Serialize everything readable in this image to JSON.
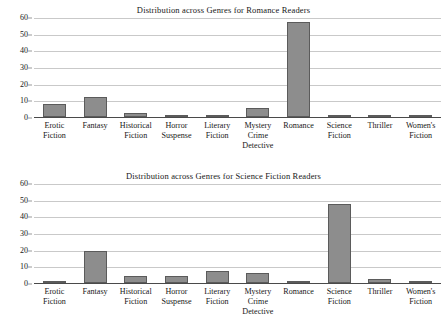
{
  "chart_data": [
    {
      "type": "bar",
      "title": "Distribution across Genres for Romance Readers",
      "xlabel": "",
      "ylabel": "",
      "ylim": [
        0,
        60
      ],
      "yticks": [
        0,
        10,
        20,
        30,
        40,
        50,
        60
      ],
      "grid": true,
      "legend": "none",
      "categories": [
        "Erotic\nFiction",
        "Fantasy",
        "Historical\nFiction",
        "Horror\nSuspense",
        "Literary\nFiction",
        "Mystery\nCrime\nDetective",
        "Romance",
        "Science\nFiction",
        "Thriller",
        "Women's\nFiction"
      ],
      "values": [
        8,
        12,
        2.5,
        0.7,
        1,
        5.5,
        57,
        1.5,
        0.6,
        1.3
      ]
    },
    {
      "type": "bar",
      "title": "Distribution across Genres for Science Fiction Readers",
      "xlabel": "",
      "ylabel": "",
      "ylim": [
        0,
        60
      ],
      "yticks": [
        0,
        10,
        20,
        30,
        40,
        50,
        60
      ],
      "grid": true,
      "legend": "none",
      "categories": [
        "Erotic\nFiction",
        "Fantasy",
        "Historical\nFiction",
        "Horror\nSuspense",
        "Literary\nFiction",
        "Mystery\nCrime\nDetective",
        "Romance",
        "Science\nFiction",
        "Thriller",
        "Women's\nFiction"
      ],
      "values": [
        1,
        19.5,
        4.5,
        4,
        7,
        6,
        1.5,
        47.5,
        2.5,
        0.7
      ]
    }
  ],
  "style": {
    "bar_fill": "#8d8d8d",
    "bar_stroke": "#5b5b5b",
    "gridline": "#c9c9c9",
    "axis": "#4a4a4a",
    "text": "#171717",
    "background": "#ffffff"
  }
}
